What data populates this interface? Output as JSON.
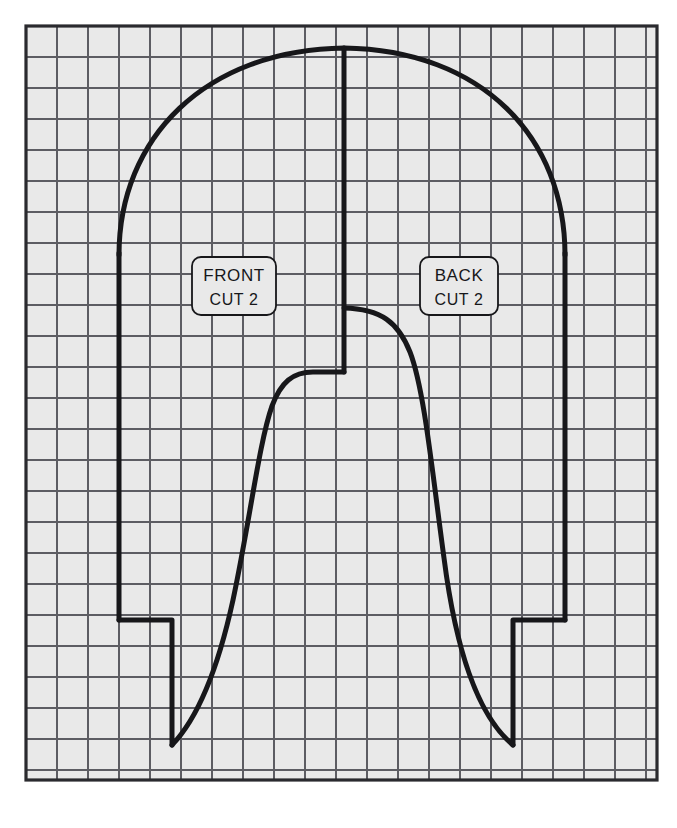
{
  "document": {
    "type": "sewing-pattern-sheet",
    "title": "Trouser / Pant Pattern on Grid",
    "background_color": "#ffffff",
    "paper_color": "#e9e9e9",
    "ink_color": "#17171a"
  },
  "grid": {
    "visible": true,
    "cell_size_px": 31,
    "columns": 20,
    "rows": 24,
    "left_px": 26,
    "top_px": 26,
    "right_px": 657,
    "bottom_px": 780,
    "line_color": "#5d5d63",
    "border_color": "#2a2a2e",
    "border_width_px": 3
  },
  "labels": [
    {
      "id": "front-label",
      "name": "FRONT",
      "line1": "FRONT",
      "line2": "CUT 2",
      "x": 192,
      "y": 257,
      "width": 84,
      "height": 58
    },
    {
      "id": "back-label",
      "name": "BACK",
      "line1": "BACK",
      "line2": "CUT 2",
      "x": 420,
      "y": 257,
      "width": 78,
      "height": 58
    }
  ],
  "pattern": {
    "name": "pant-front-and-back",
    "stroke_width_px": 5,
    "center_fold_line": {
      "name": "center-fold-line",
      "x": 344,
      "y_top": 48,
      "y_bottom": 372
    },
    "waist_arch": {
      "name": "waist-arch",
      "left_x": 119,
      "right_x": 565,
      "apex_y": 48,
      "side_start_y": 255
    },
    "left_side_seam": {
      "x": 119,
      "y_top": 255,
      "y_bottom": 620
    },
    "right_side_seam": {
      "x": 565,
      "y_top": 255,
      "y_bottom": 620
    },
    "left_notch": {
      "outer_x": 119,
      "inner_x": 172,
      "top_y": 620,
      "bottom_y": 745
    },
    "right_notch": {
      "outer_x": 565,
      "inner_x": 513,
      "top_y": 620,
      "bottom_y": 745
    },
    "front_inseam": {
      "name": "front-inseam-curve",
      "crotch_x": 344,
      "crotch_y": 372,
      "hem_x": 172,
      "hem_y": 745
    },
    "back_inseam": {
      "name": "back-inseam-curve",
      "crotch_x": 344,
      "crotch_y": 308,
      "hem_x": 513,
      "hem_y": 745
    }
  }
}
